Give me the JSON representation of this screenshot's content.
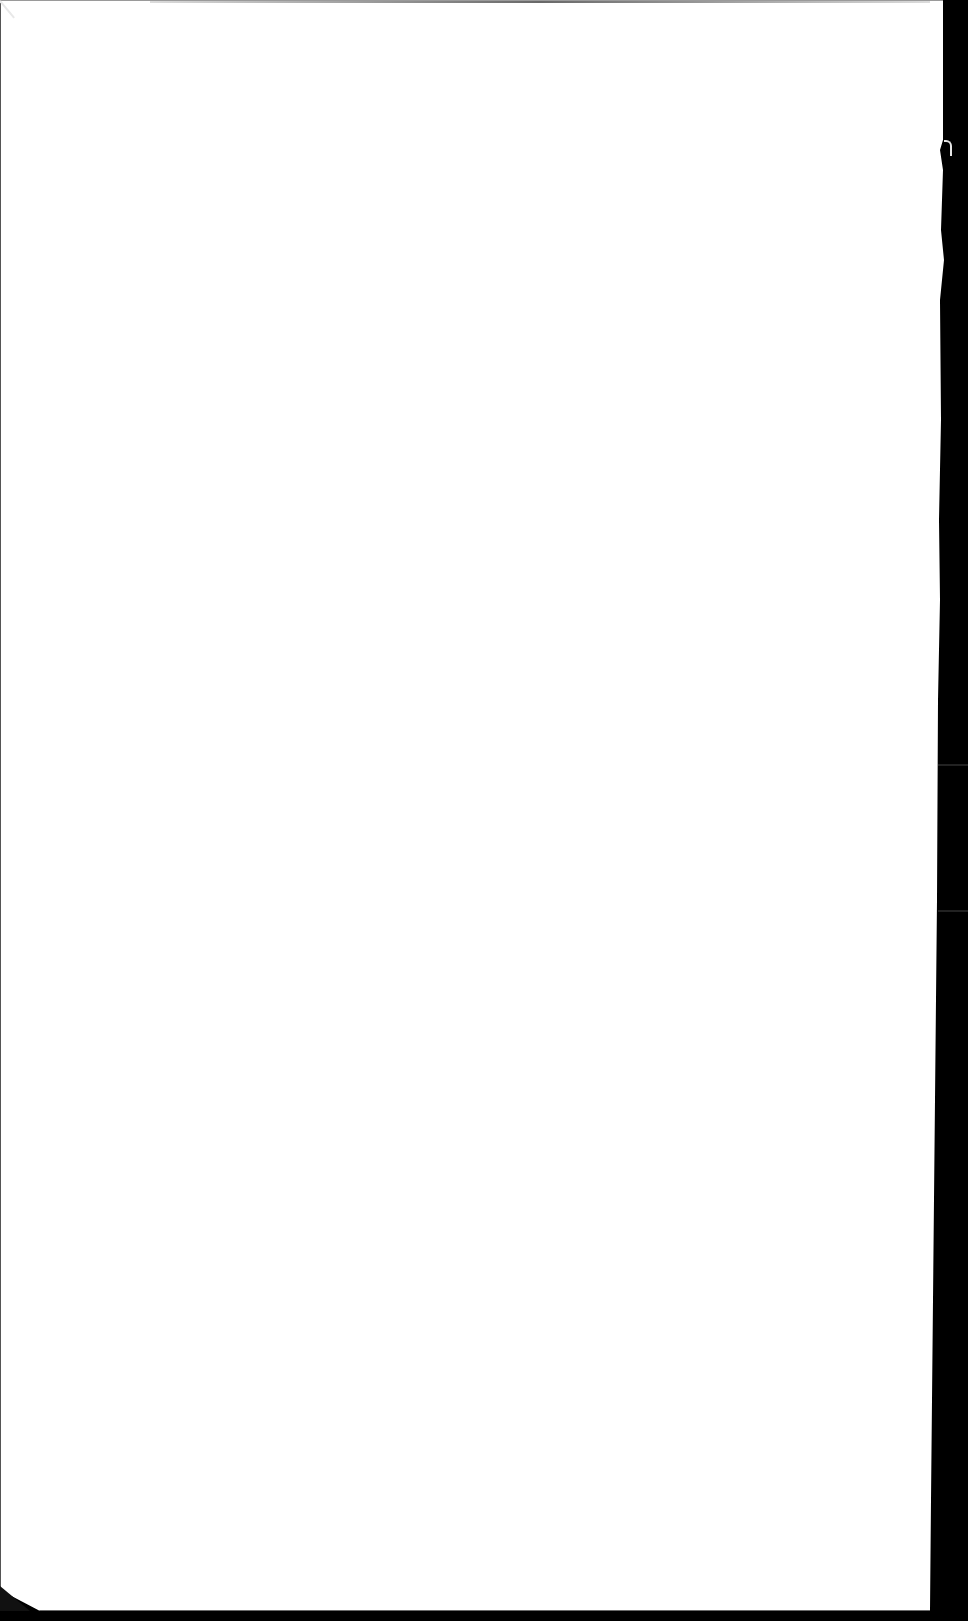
{
  "document": {
    "type": "scanned blank sheet",
    "text_content": "",
    "colors": {
      "page": "#ffffff",
      "background": "#000000",
      "edge_shadow": "#6a6a6a"
    }
  }
}
